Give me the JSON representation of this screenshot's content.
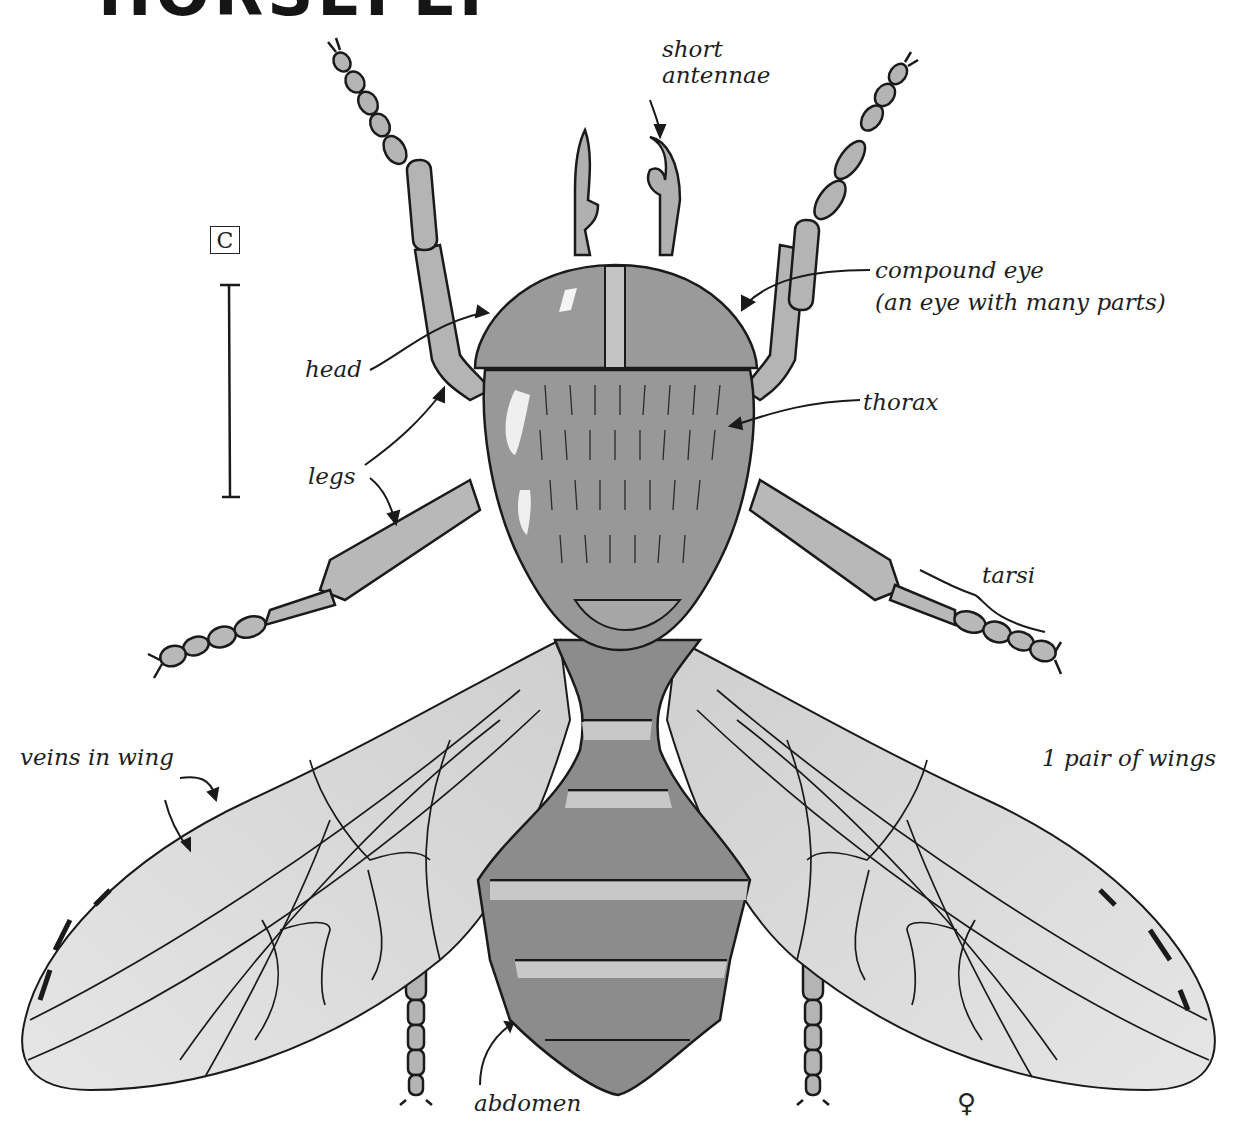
{
  "figure": {
    "title": "HORSEFLY",
    "title_visibility": "partially cropped at top edge",
    "scale_marker": {
      "letter": "C"
    },
    "sex_symbol": "♀",
    "colors": {
      "line": "#1a1a1a",
      "body_fill": "#9a9a9a",
      "wing_fill": "#d9d9d9",
      "background": "#ffffff"
    }
  },
  "labels": {
    "antennae": {
      "line1": "short",
      "line2": "antennae"
    },
    "compound_eye": {
      "line1": "compound eye",
      "line2": "(an eye with many parts)"
    },
    "head": "head",
    "thorax": "thorax",
    "legs": "legs",
    "tarsi": "tarsi",
    "wings": "1 pair of wings",
    "veins": "veins in wing",
    "abdomen": "abdomen"
  }
}
